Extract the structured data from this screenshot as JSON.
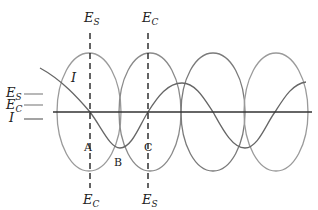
{
  "diagram": {
    "top_labels": {
      "es": "E",
      "es_sub": "S",
      "ec": "E",
      "ec_sub": "C"
    },
    "bottom_labels": {
      "ec": "E",
      "ec_sub": "C",
      "es": "E",
      "es_sub": "S"
    },
    "legend": [
      {
        "label": "E",
        "sub": "S"
      },
      {
        "label": "E",
        "sub": "C"
      },
      {
        "label": "I",
        "sub": ""
      }
    ],
    "curve_label": "I",
    "points": {
      "a": "A",
      "b": "B",
      "c": "C"
    },
    "colors": {
      "axis": "#333333",
      "es": "#9a9a9a",
      "ec": "#6f6f6f",
      "current": "#666666",
      "dashed": "#222222"
    }
  }
}
